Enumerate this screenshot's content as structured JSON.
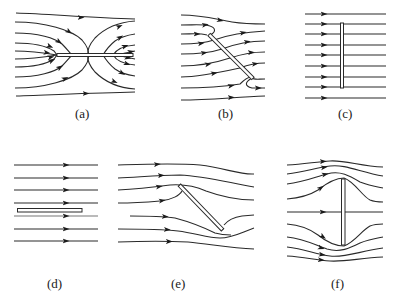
{
  "figure": {
    "panels": [
      {
        "id": "a",
        "label": "(a)",
        "plate_orientation": "horizontal, aligned with flow (with stagnation loops at ends)"
      },
      {
        "id": "b",
        "label": "(b)",
        "plate_orientation": "inclined, potential flow around plate"
      },
      {
        "id": "c",
        "label": "(c)",
        "plate_orientation": "vertical, streamlines straight through"
      },
      {
        "id": "d",
        "label": "(d)",
        "plate_orientation": "horizontal, streamlines straight"
      },
      {
        "id": "e",
        "label": "(e)",
        "plate_orientation": "inclined, streamlines deflected"
      },
      {
        "id": "f",
        "label": "(f)",
        "plate_orientation": "vertical, streamlines deflected around plate"
      }
    ]
  },
  "colors": {
    "stroke": "#2a2a2a",
    "background": "#ffffff"
  }
}
